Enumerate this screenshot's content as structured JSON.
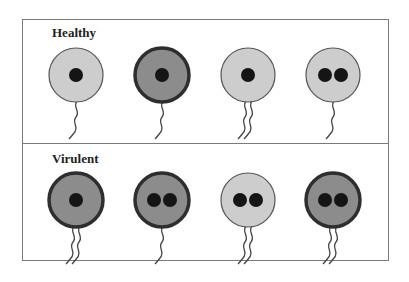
{
  "panels": [
    {
      "label": "Healthy",
      "cells": [
        {
          "shade": "light",
          "nuclei": 1,
          "flagella": 1
        },
        {
          "shade": "dark",
          "nuclei": 1,
          "flagella": 1
        },
        {
          "shade": "light",
          "nuclei": 1,
          "flagella": 2
        },
        {
          "shade": "light",
          "nuclei": 2,
          "flagella": 1
        }
      ]
    },
    {
      "label": "Virulent",
      "cells": [
        {
          "shade": "dark",
          "nuclei": 1,
          "flagella": 2
        },
        {
          "shade": "dark",
          "nuclei": 2,
          "flagella": 1
        },
        {
          "shade": "light",
          "nuclei": 2,
          "flagella": 2
        },
        {
          "shade": "dark",
          "nuclei": 2,
          "flagella": 2
        }
      ]
    }
  ],
  "colors": {
    "light_fill": "#cdcdcd",
    "light_stroke": "#555555",
    "dark_fill": "#8c8c8c",
    "dark_stroke": "#2e2e2e",
    "nucleus": "#151515",
    "flagellum": "#444444",
    "frame": "#7a7a7a"
  }
}
